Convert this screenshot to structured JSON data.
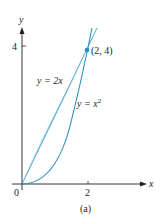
{
  "figure": {
    "caption": "(a)",
    "x_axis_label": "x",
    "y_axis_label": "y",
    "x_ticks": [
      {
        "value": 0,
        "label": "0"
      },
      {
        "value": 2,
        "label": "2"
      }
    ],
    "y_ticks": [
      {
        "value": 4,
        "label": "4"
      }
    ],
    "curves": [
      {
        "name": "line",
        "label_prefix": "y = ",
        "label_expr": "2x",
        "equation": "y = 2x"
      },
      {
        "name": "parabola",
        "label_prefix": "y = ",
        "label_expr": "x",
        "label_exp": "2",
        "equation": "y = x^2"
      }
    ],
    "intersection_point": {
      "x": 2,
      "y": 4,
      "label": "(2, 4)"
    },
    "shaded_region": "between y = 2x and y = x^2 for 0 ≤ x ≤ 2",
    "colors": {
      "curve": "#2a8fc4",
      "fill": "#cde9f6",
      "axis": "#231f20",
      "point": "#2a8fc4"
    }
  }
}
